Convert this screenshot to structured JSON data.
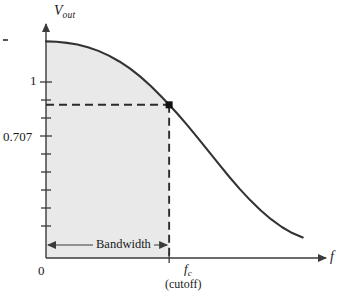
{
  "figure": {
    "kind": "frequency-response-plot",
    "background_color": "#ffffff",
    "curve_color": "#333333",
    "shade_color": "#e9e9e9",
    "axis_color": "#444444"
  },
  "labels": {
    "y_axis": "V",
    "y_axis_sub": "out",
    "x_axis": "f",
    "origin": "0",
    "unity_gain": "1",
    "cutoff_gain": "0.707",
    "cutoff_freq": "f",
    "cutoff_freq_sub": "c",
    "cutoff_note": "(cutoff)",
    "bandwidth": "Bandwidth"
  },
  "chart_data": {
    "type": "line",
    "title": "",
    "xlabel": "f",
    "ylabel": "Vout",
    "grid": false,
    "legend": null,
    "xlim": [
      0,
      1
    ],
    "ylim": [
      0,
      1.08
    ],
    "x_ticks": [
      {
        "value": 0,
        "label": "0"
      },
      {
        "value": 0.47,
        "label": "fc"
      }
    ],
    "y_ticks": [
      {
        "value": 1.0,
        "label": "1"
      },
      {
        "value": 0.707,
        "label": "0.707"
      }
    ],
    "series": [
      {
        "name": "Low-pass filter response",
        "x": [
          0.0,
          0.04,
          0.08,
          0.12,
          0.16,
          0.2,
          0.24,
          0.28,
          0.32,
          0.36,
          0.4,
          0.44,
          0.47,
          0.5,
          0.54,
          0.58,
          0.62,
          0.66,
          0.7,
          0.74,
          0.78,
          0.82,
          0.86,
          0.9,
          0.94,
          0.98
        ],
        "y": [
          1.0,
          0.998,
          0.993,
          0.985,
          0.973,
          0.956,
          0.934,
          0.907,
          0.875,
          0.837,
          0.794,
          0.745,
          0.707,
          0.668,
          0.612,
          0.553,
          0.493,
          0.433,
          0.374,
          0.318,
          0.266,
          0.219,
          0.178,
          0.143,
          0.115,
          0.095
        ]
      }
    ],
    "shaded_region": {
      "label": "Bandwidth",
      "x_from": 0.0,
      "x_to": 0.47,
      "description": "passband area under curve from DC to cutoff frequency"
    },
    "markers": [
      {
        "x": 0.47,
        "y": 0.707,
        "label": "cutoff point",
        "style": "filled-square"
      }
    ],
    "guide_lines": [
      {
        "orientation": "horizontal",
        "value": 0.707,
        "style": "dashed",
        "from_x": 0.0,
        "to_x": 0.47
      },
      {
        "orientation": "vertical",
        "value": 0.47,
        "style": "dashed",
        "from_y": 0.0,
        "to_y": 0.707
      }
    ],
    "annotations": [
      {
        "text": "Bandwidth",
        "type": "double-arrow",
        "x_from": 0.0,
        "x_to": 0.47,
        "y": 0.12
      }
    ]
  }
}
